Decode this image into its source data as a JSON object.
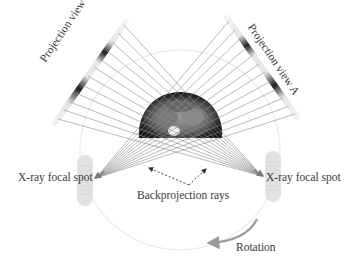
{
  "diagram": {
    "labels": {
      "projection_b": "Projection view B",
      "projection_a": "Projection view A",
      "focal_spot_left": "X-ray focal spot",
      "focal_spot_right": "X-ray focal spot",
      "backprojection": "Backprojection rays",
      "rotation": "Rotation"
    },
    "colors": {
      "ray": "#8c8c8c",
      "detector_dark": "#2a2a2a",
      "focal_spot_fill": "#e2e2e2",
      "gantry_circle": "#ececec",
      "patient_dark": "#1c1c1c",
      "patient_tissue": "#8a8a8a",
      "rotation_arrow": "#9a9a9a",
      "text": "#3a3a3a"
    },
    "elements": [
      "Projection view B detector (upper-left)",
      "Projection view A detector (upper-right)",
      "X-ray focal spot (left)",
      "X-ray focal spot (right)",
      "Patient CT cross-section (center)",
      "Backprojection rays (dashed arrows)",
      "Rotation arrow (bottom-right)"
    ]
  }
}
